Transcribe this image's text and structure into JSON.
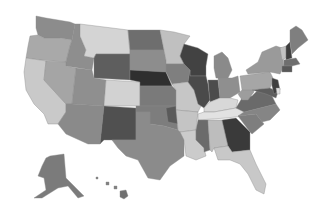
{
  "map": {
    "title": "",
    "type": "choropleth",
    "palette": "grayscale",
    "background": "#ffffff",
    "states": [
      {
        "id": "WA",
        "name": "Washington",
        "fill": "#8c8c8c",
        "points": "36,16 46,18 70,22 75,24 72,40 60,38 44,38 38,35 36,28"
      },
      {
        "id": "OR",
        "name": "Oregon",
        "fill": "#a9a9a9",
        "points": "30,36 38,35 44,38 60,38 72,40 70,46 66,62 40,60 26,58 28,46"
      },
      {
        "id": "CA",
        "name": "California",
        "fill": "#c9c9c9",
        "points": "26,58 40,60 46,61 44,80 66,104 66,112 58,124 48,124 44,114 34,104 26,90 24,72"
      },
      {
        "id": "ID",
        "name": "Idaho",
        "fill": "#8e8e8e",
        "points": "75,24 80,24 80,36 86,50 84,56 94,58 92,70 66,66 66,62 70,46 72,40"
      },
      {
        "id": "NV",
        "name": "Nevada",
        "fill": "#a5a5a5",
        "points": "46,61 66,62 66,66 76,68 72,104 66,104 44,80"
      },
      {
        "id": "MT",
        "name": "Montana",
        "fill": "#d4d4d4",
        "points": "80,24 104,27 128,30 130,54 96,54 94,58 84,56 86,50 80,36"
      },
      {
        "id": "WY",
        "name": "Wyoming",
        "fill": "#5e5e5e",
        "points": "96,54 130,54 130,80 94,78 94,58"
      },
      {
        "id": "UT",
        "name": "Utah",
        "fill": "#8f8f8f",
        "points": "76,68 92,70 94,78 106,80 104,106 72,104"
      },
      {
        "id": "AZ",
        "name": "Arizona",
        "fill": "#8a8a8a",
        "points": "72,104 104,106 100,144 88,144 66,134 58,124 66,112 66,104"
      },
      {
        "id": "CO",
        "name": "Colorado",
        "fill": "#d2d2d2",
        "points": "106,80 140,82 140,106 104,106"
      },
      {
        "id": "NM",
        "name": "New Mexico",
        "fill": "#505050",
        "points": "104,106 136,108 136,140 112,140 104,140 100,144"
      },
      {
        "id": "ND",
        "name": "North Dakota",
        "fill": "#6e6e6e",
        "points": "128,30 160,30 164,50 130,50"
      },
      {
        "id": "SD",
        "name": "South Dakota",
        "fill": "#8d8d8d",
        "points": "130,50 164,50 166,60 166,72 130,70"
      },
      {
        "id": "NE",
        "name": "Nebraska",
        "fill": "#2f2f2f",
        "points": "130,70 166,72 172,86 140,86 140,82 130,80"
      },
      {
        "id": "KS",
        "name": "Kansas",
        "fill": "#7a7a7a",
        "points": "140,86 172,86 176,90 176,106 140,106"
      },
      {
        "id": "OK",
        "name": "Oklahoma",
        "fill": "#7d7d7d",
        "points": "136,106 176,106 178,130 164,126 150,124 150,112 136,112"
      },
      {
        "id": "TX",
        "name": "Texas",
        "fill": "#8b8b8b",
        "points": "136,112 150,112 150,124 164,126 178,130 184,134 184,156 170,166 160,180 148,178 138,160 126,156 118,148 112,140 136,140"
      },
      {
        "id": "OKP",
        "name": "Oklahoma (east)",
        "fill": "#5a5a5a",
        "points": "166,108 176,106 178,124 168,122"
      },
      {
        "id": "MN",
        "name": "Minnesota",
        "fill": "#c0c0c0",
        "points": "160,30 174,32 190,36 184,44 180,56 184,64 166,64 166,60 164,50"
      },
      {
        "id": "IA",
        "name": "Iowa",
        "fill": "#7f7f7f",
        "points": "166,64 184,64 190,70 188,82 172,84 166,72"
      },
      {
        "id": "MO",
        "name": "Missouri",
        "fill": "#c6c6c6",
        "points": "172,84 188,82 194,90 202,104 198,112 176,110 176,90"
      },
      {
        "id": "AR",
        "name": "Arkansas",
        "fill": "#c4c4c4",
        "points": "176,110 198,112 196,130 180,132 178,130"
      },
      {
        "id": "LA",
        "name": "Louisiana",
        "fill": "#cbcbcb",
        "points": "180,132 196,130 196,140 204,148 206,156 196,160 186,156 184,140"
      },
      {
        "id": "WI",
        "name": "Wisconsin",
        "fill": "#424242",
        "points": "184,44 198,48 208,54 206,66 206,76 190,76 190,70 184,64 180,56"
      },
      {
        "id": "IL",
        "name": "Illinois",
        "fill": "#4a4a4a",
        "points": "190,76 206,76 208,84 210,100 204,108 198,104 194,90 188,82 190,70"
      },
      {
        "id": "MI",
        "name": "Michigan",
        "fill": "#8a8a8a",
        "points": "214,56 222,52 228,58 232,70 228,78 216,78 214,68"
      },
      {
        "id": "IN",
        "name": "Indiana",
        "fill": "#4c4c4c",
        "points": "208,80 218,80 220,98 210,102"
      },
      {
        "id": "OH",
        "name": "Ohio",
        "fill": "#8f8f8f",
        "points": "218,78 232,78 238,76 240,92 230,98 220,98"
      },
      {
        "id": "KY",
        "name": "Kentucky",
        "fill": "#d8d8d8",
        "points": "204,108 210,102 220,98 230,98 238,100 236,108 214,112 204,112"
      },
      {
        "id": "TN",
        "name": "Tennessee",
        "fill": "#e2e2e2",
        "points": "198,114 204,112 214,112 236,108 248,106 244,116 226,118 198,120"
      },
      {
        "id": "MS",
        "name": "Mississippi",
        "fill": "#6b6b6b",
        "points": "198,120 208,120 210,150 204,152 204,148 196,140 196,130"
      },
      {
        "id": "AL",
        "name": "Alabama",
        "fill": "#bdbdbd",
        "points": "208,120 222,120 228,146 214,148 212,152 210,150"
      },
      {
        "id": "GA",
        "name": "Georgia",
        "fill": "#3a3a3a",
        "points": "222,120 236,118 250,132 250,150 232,152 228,146"
      },
      {
        "id": "FL",
        "name": "Florida",
        "fill": "#c8c8c8",
        "points": "214,148 228,146 232,152 250,150 256,164 266,184 264,194 256,190 248,174 240,164 230,160 218,160"
      },
      {
        "id": "SC",
        "name": "South Carolina",
        "fill": "#7e7e7e",
        "points": "238,116 256,114 264,124 252,134 250,132"
      },
      {
        "id": "NC",
        "name": "North Carolina",
        "fill": "#858585",
        "points": "244,112 276,104 280,110 270,120 262,122 256,114 238,116"
      },
      {
        "id": "VA",
        "name": "Virginia",
        "fill": "#6a6a6a",
        "points": "236,108 242,98 252,96 260,88 270,92 276,104 244,112"
      },
      {
        "id": "WV",
        "name": "West Virginia",
        "fill": "#9d9d9d",
        "points": "238,94 246,86 252,86 254,92 248,100 242,100"
      },
      {
        "id": "PA",
        "name": "Pennsylvania",
        "fill": "#a6a6a6",
        "points": "240,76 270,72 274,80 270,88 252,90 242,90"
      },
      {
        "id": "NY",
        "name": "New York",
        "fill": "#9a9a9a",
        "points": "246,70 258,62 262,52 276,46 282,48 284,66 280,74 270,72 248,74"
      },
      {
        "id": "MD",
        "name": "Maryland",
        "fill": "#5d5d5d",
        "points": "252,90 270,88 278,92 276,98 266,94"
      },
      {
        "id": "NJ",
        "name": "New Jersey",
        "fill": "#3f3f3f",
        "points": "272,78 278,80 280,90 274,94 272,86"
      },
      {
        "id": "DE",
        "name": "Delaware",
        "fill": "#e0e0e0",
        "points": "276,88 280,88 280,94 277,94"
      },
      {
        "id": "VT",
        "name": "Vermont",
        "fill": "#c2c2c2",
        "points": "280,48 286,46 286,58 282,60"
      },
      {
        "id": "NH",
        "name": "New Hampshire",
        "fill": "#3e3e3e",
        "points": "286,46 290,42 292,58 286,60"
      },
      {
        "id": "MA",
        "name": "Massachusetts",
        "fill": "#6e6e6e",
        "points": "284,60 296,58 300,64 292,66 284,66"
      },
      {
        "id": "CT",
        "name": "Connecticut",
        "fill": "#585858",
        "points": "282,66 292,66 292,72 282,72"
      },
      {
        "id": "ME",
        "name": "Maine",
        "fill": "#7f7f7f",
        "points": "290,30 296,26 302,30 308,40 298,48 292,54 290,42"
      },
      {
        "id": "AK",
        "name": "Alaska",
        "fill": "#7b7b7b",
        "points": "50,156 64,154 66,178 74,186 84,196 78,198 68,186 58,188 42,198 34,198 46,190 44,178 38,176 42,166 46,158"
      },
      {
        "id": "HI1",
        "name": "Hawaii (Kauai)",
        "fill": "#808080",
        "points": "96,177 98,177 98,179 96,179"
      },
      {
        "id": "HI2",
        "name": "Hawaii (Oahu)",
        "fill": "#808080",
        "points": "106,182 109,182 109,185 106,185"
      },
      {
        "id": "HI3",
        "name": "Hawaii (Maui)",
        "fill": "#808080",
        "points": "114,186 117,186 117,189 114,189"
      },
      {
        "id": "HI4",
        "name": "Hawaii (Big Island)",
        "fill": "#707070",
        "points": "120,191 126,190 128,196 124,199 120,197"
      }
    ]
  }
}
